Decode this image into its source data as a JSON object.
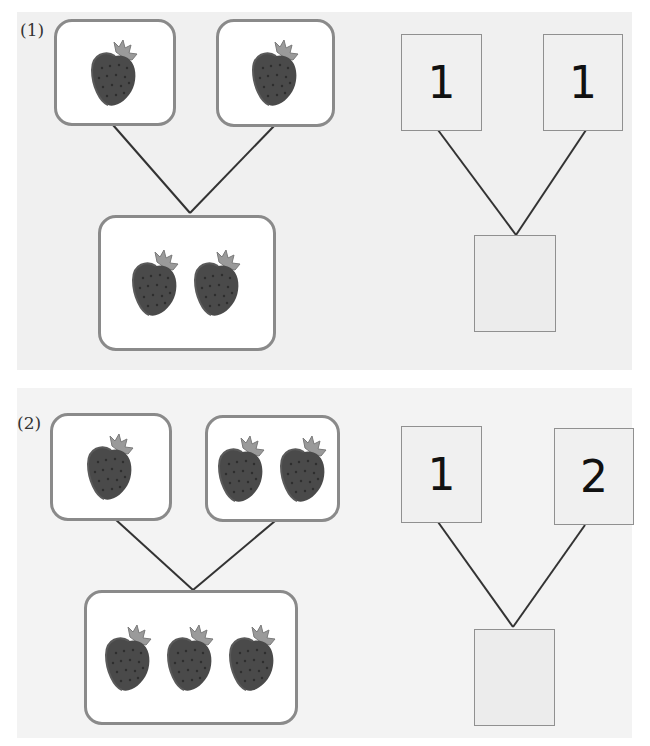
{
  "problems": [
    {
      "label": "(1)",
      "pictures": {
        "left_count": 1,
        "right_count": 1,
        "total_count": 2
      },
      "numbers": {
        "left": "1",
        "right": "1",
        "total": ""
      }
    },
    {
      "label": "(2)",
      "pictures": {
        "left_count": 1,
        "right_count": 2,
        "total_count": 3
      },
      "numbers": {
        "left": "1",
        "right": "2",
        "total": ""
      }
    }
  ],
  "icon": "strawberry-icon",
  "colors": {
    "panel_bg": "#f0f0f0",
    "box_border": "#8a8a8a",
    "line": "#333333",
    "digit": "#111111"
  }
}
